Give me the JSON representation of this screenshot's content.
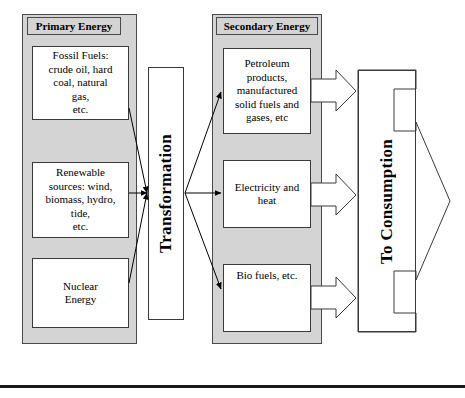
{
  "diagram": {
    "colors": {
      "panel_fill": "#d4d4d4",
      "box_fill": "#ffffff",
      "stroke": "#3a3a3a",
      "panel_stroke": "#4a4a4a",
      "rule": "#1a1a1a"
    }
  },
  "columns": {
    "primary": {
      "header": "Primary Energy",
      "boxes": [
        {
          "label": "Fossil Fuels:\ncrude oil, hard\ncoal, natural\ngas,\netc."
        },
        {
          "label": "Renewable\nsources: wind,\nbiomass, hydro,\ntide,\netc."
        },
        {
          "label": "Nuclear\nEnergy"
        }
      ]
    },
    "secondary": {
      "header": "Secondary Energy",
      "boxes": [
        {
          "label": "Petroleum\nproducts,\nmanufactured\nsolid fuels and\ngases, etc"
        },
        {
          "label": "Electricity and\nheat"
        },
        {
          "label": "Bio fuels, etc."
        }
      ]
    }
  },
  "process": {
    "transformation_label": "Transformation",
    "consumption_label": "To Consumption"
  },
  "connectors": {
    "primary_to_transformation": "three-lines-converging-arrow",
    "transformation_to_secondary": "three-lines-diverging-arrows",
    "secondary_to_consumption": "three-block-arrows",
    "consumption_output": "large-block-arrow-right"
  }
}
